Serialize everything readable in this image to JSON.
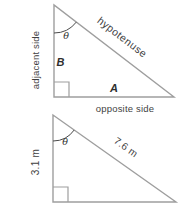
{
  "figure": {
    "background_color": "#ffffff",
    "line_color": "#9e9e9e",
    "arc_color": "#4a4a4a",
    "text_color": "#3f3f3f",
    "top_triangle": {
      "angle_symbol": "θ",
      "left_side_label": "adjacent side",
      "hypotenuse_label": "hypotenuse",
      "bottom_side_label": "opposite side",
      "vertical_leg_name": "B",
      "horizontal_leg_name": "A"
    },
    "bottom_triangle": {
      "angle_symbol": "θ",
      "left_side_length": "3.1 m",
      "hypotenuse_length": "7.6 m"
    }
  }
}
